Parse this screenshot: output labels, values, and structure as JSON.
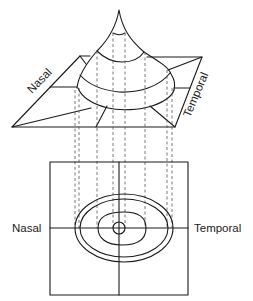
{
  "figure": {
    "surface_3d": {
      "label_left": "Nasal",
      "label_right": "Temporal"
    },
    "contour_map": {
      "label_left": "Nasal",
      "label_right": "Temporal"
    }
  },
  "colors": {
    "line": "#1a1a1a",
    "dash": "#555555",
    "background": "#ffffff"
  }
}
